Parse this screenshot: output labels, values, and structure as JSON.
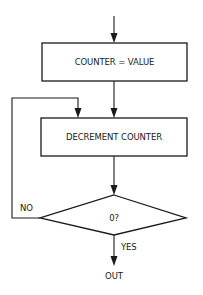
{
  "diagram": {
    "type": "flowchart",
    "nodes": [
      {
        "id": "init",
        "shape": "rectangle",
        "label": "COUNTER = VALUE"
      },
      {
        "id": "decrement",
        "shape": "rectangle",
        "label": "DECREMENT COUNTER"
      },
      {
        "id": "test",
        "shape": "diamond",
        "label": "0?"
      },
      {
        "id": "out",
        "shape": "terminal-text",
        "label": "OUT"
      }
    ],
    "edges": [
      {
        "from": "entry",
        "to": "init",
        "label": ""
      },
      {
        "from": "init",
        "to": "decrement",
        "label": ""
      },
      {
        "from": "decrement",
        "to": "test",
        "label": ""
      },
      {
        "from": "test",
        "to": "decrement",
        "label": "NO"
      },
      {
        "from": "test",
        "to": "out",
        "label": "YES"
      }
    ],
    "labels": {
      "init": "COUNTER = VALUE",
      "decrement": "DECREMENT COUNTER",
      "test": "0?",
      "no": "NO",
      "yes": "YES",
      "out": "OUT"
    },
    "colors": {
      "stroke": "#1a1a1a",
      "background": "#ffffff"
    }
  }
}
